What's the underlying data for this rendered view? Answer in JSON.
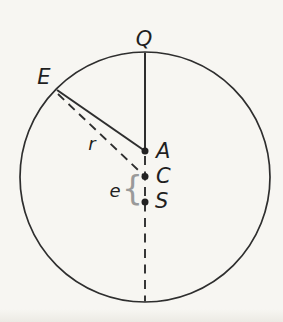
{
  "figure": {
    "type": "geometry-diagram",
    "alt": "Circle with point Q at top, point E on upper-left circumference, and points A, C, S on the vertical diameter; a solid segment joins E to A, dashed segments join E to C and run down the lower diameter; r labels the radius toward E and e labels the braced distance between C and S",
    "labels": {
      "q": "Q",
      "e_point": "E",
      "a": "A",
      "c": "C",
      "s": "S",
      "radius": "r",
      "distance": "e",
      "brace": "{"
    },
    "colors": {
      "ink": "#2e2e2e",
      "brace": "#9a9a9a",
      "paper": "#f7f6f2"
    }
  }
}
